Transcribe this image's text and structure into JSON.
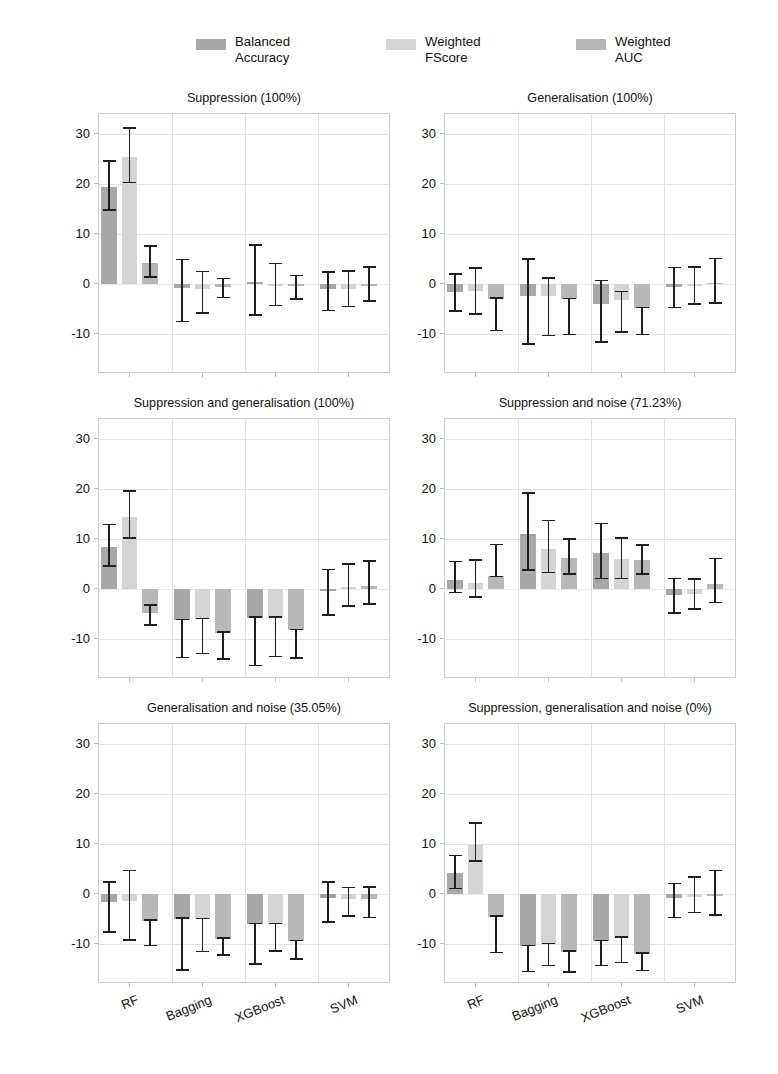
{
  "figure": {
    "ylabel": "Δ Performance (%)",
    "yticks": [
      "30",
      "20",
      "10",
      "0",
      "-10"
    ],
    "ytick_values": [
      30,
      20,
      10,
      0,
      -10
    ],
    "ylim": [
      -18,
      34
    ],
    "categories": [
      "RF",
      "Bagging",
      "XGBoost",
      "SVM"
    ],
    "grid": true,
    "legend_position": "top-center"
  },
  "legend": {
    "items": [
      {
        "label": "Balanced\nAccuracy",
        "color": "#a8a8a8"
      },
      {
        "label": "Weighted\nFScore",
        "color": "#d4d4d4"
      },
      {
        "label": "Weighted\nAUC",
        "color": "#b8b8b8"
      }
    ]
  },
  "chart_data": {
    "type": "bar",
    "title": "",
    "xlabel": "",
    "ylabel": "Δ Performance (%)",
    "ylim": [
      -18,
      34
    ],
    "categories": [
      "RF",
      "Bagging",
      "XGBoost",
      "SVM"
    ],
    "series_names": [
      "Balanced Accuracy",
      "Weighted FScore",
      "Weighted AUC"
    ],
    "grid": true,
    "panels": [
      {
        "title": "Suppression (100%)",
        "series": [
          {
            "name": "Balanced Accuracy",
            "values": [
              19.5,
              -0.8,
              0.5,
              -0.9
            ],
            "err_low": [
              14.8,
              -7.5,
              -6.2,
              -5.3
            ],
            "err_high": [
              24.6,
              4.9,
              7.8,
              2.4
            ]
          },
          {
            "name": "Weighted FScore",
            "values": [
              25.5,
              -1.0,
              -0.3,
              -1.0
            ],
            "err_low": [
              20.3,
              -5.8,
              -4.3,
              -4.5
            ],
            "err_high": [
              31.2,
              2.5,
              4.1,
              2.6
            ]
          },
          {
            "name": "Weighted AUC",
            "values": [
              4.2,
              -0.6,
              -0.4,
              -0.2
            ],
            "err_low": [
              1.4,
              -2.7,
              -3.0,
              -3.4
            ],
            "err_high": [
              7.6,
              1.1,
              1.7,
              3.4
            ]
          }
        ]
      },
      {
        "title": "Generalisation (100%)",
        "series": [
          {
            "name": "Balanced Accuracy",
            "values": [
              -1.6,
              -2.4,
              -4.0,
              -0.5
            ],
            "err_low": [
              -5.4,
              -12.0,
              -11.6,
              -4.7
            ],
            "err_high": [
              2.0,
              5.0,
              0.7,
              3.3
            ]
          },
          {
            "name": "Weighted FScore",
            "values": [
              -1.3,
              -2.3,
              -3.2,
              -0.4
            ],
            "err_low": [
              -6.0,
              -10.3,
              -9.6,
              -4.0
            ],
            "err_high": [
              3.2,
              1.2,
              -1.5,
              3.4
            ]
          },
          {
            "name": "Weighted AUC",
            "values": [
              -2.9,
              -3.0,
              -4.8,
              0.3
            ],
            "err_low": [
              -9.3,
              -10.1,
              -10.1,
              -3.8
            ],
            "err_high": [
              -2.8,
              -2.9,
              -4.7,
              5.1
            ]
          }
        ]
      },
      {
        "title": "Suppression and generalisation (100%)",
        "series": [
          {
            "name": "Balanced Accuracy",
            "values": [
              8.5,
              -6.2,
              -5.7,
              -0.4
            ],
            "err_low": [
              4.6,
              -13.7,
              -15.3,
              -5.2
            ],
            "err_high": [
              12.9,
              -6.1,
              -5.6,
              3.9
            ]
          },
          {
            "name": "Weighted FScore",
            "values": [
              14.5,
              -6.0,
              -5.7,
              0.5
            ],
            "err_low": [
              10.2,
              -12.9,
              -13.5,
              -3.4
            ],
            "err_high": [
              19.6,
              -5.9,
              -5.6,
              5.0
            ]
          },
          {
            "name": "Weighted AUC",
            "values": [
              -4.8,
              -8.7,
              -8.2,
              0.7
            ],
            "err_low": [
              -7.2,
              -14.0,
              -13.8,
              -3.0
            ],
            "err_high": [
              -3.2,
              -8.6,
              -8.1,
              5.6
            ]
          }
        ]
      },
      {
        "title": "Suppression and noise (71.23%)",
        "series": [
          {
            "name": "Balanced Accuracy",
            "values": [
              1.8,
              11.0,
              7.3,
              -1.1
            ],
            "err_low": [
              -0.7,
              3.8,
              2.1,
              -4.8
            ],
            "err_high": [
              5.5,
              19.2,
              13.1,
              2.1
            ]
          },
          {
            "name": "Weighted FScore",
            "values": [
              1.2,
              8.0,
              6.0,
              -1.0
            ],
            "err_low": [
              -1.6,
              3.3,
              2.1,
              -4.0
            ],
            "err_high": [
              5.8,
              13.7,
              10.2,
              2.0
            ]
          },
          {
            "name": "Weighted AUC",
            "values": [
              2.6,
              6.2,
              5.8,
              1.0
            ],
            "err_low": [
              2.5,
              3.0,
              3.0,
              -2.7
            ],
            "err_high": [
              8.9,
              10.0,
              8.8,
              6.1
            ]
          }
        ]
      },
      {
        "title": "Generalisation and noise (35.05%)",
        "series": [
          {
            "name": "Balanced Accuracy",
            "values": [
              -1.6,
              -4.9,
              -6.0,
              -0.8
            ],
            "err_low": [
              -7.6,
              -15.2,
              -14.0,
              -5.6
            ],
            "err_high": [
              2.4,
              -4.8,
              -5.9,
              2.4
            ]
          },
          {
            "name": "Weighted FScore",
            "values": [
              -1.4,
              -5.0,
              -6.0,
              -1.0
            ],
            "err_low": [
              -9.2,
              -11.5,
              -11.4,
              -4.4
            ],
            "err_high": [
              4.7,
              -4.9,
              -5.9,
              1.3
            ]
          },
          {
            "name": "Weighted AUC",
            "values": [
              -5.3,
              -8.9,
              -9.4,
              -1.0
            ],
            "err_low": [
              -10.3,
              -12.2,
              -13.0,
              -4.7
            ],
            "err_high": [
              -5.2,
              -8.8,
              -9.3,
              1.4
            ]
          }
        ]
      },
      {
        "title": "Suppression, generalisation and noise (0%)",
        "series": [
          {
            "name": "Balanced Accuracy",
            "values": [
              4.2,
              -10.4,
              -9.4,
              -0.7
            ],
            "err_low": [
              1.1,
              -15.5,
              -14.3,
              -4.7
            ],
            "err_high": [
              7.7,
              -10.3,
              -9.3,
              2.1
            ]
          },
          {
            "name": "Weighted FScore",
            "values": [
              9.9,
              -10.0,
              -8.7,
              -0.5
            ],
            "err_low": [
              6.6,
              -14.3,
              -13.7,
              -3.7
            ],
            "err_high": [
              14.2,
              -9.9,
              -8.6,
              3.4
            ]
          },
          {
            "name": "Weighted AUC",
            "values": [
              -4.5,
              -11.5,
              -11.9,
              -0.3
            ],
            "err_low": [
              -11.7,
              -15.6,
              -15.3,
              -4.2
            ],
            "err_high": [
              -4.4,
              -11.4,
              -11.8,
              4.7
            ]
          }
        ]
      }
    ]
  }
}
